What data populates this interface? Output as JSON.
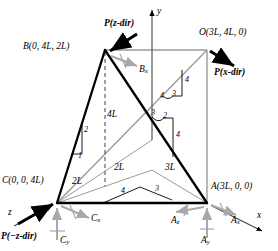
{
  "figure": {
    "type": "engineering-diagram"
  },
  "axes": [
    {
      "name": "y-axis",
      "label": "y"
    },
    {
      "name": "x-axis",
      "label": "x"
    },
    {
      "name": "z-axis",
      "label": "z"
    }
  ],
  "points": [
    {
      "name": "point-B",
      "label": "B(0, 4L, 2L)"
    },
    {
      "name": "point-O",
      "label": "O(3L, 4L, 0)"
    },
    {
      "name": "point-C",
      "label": "C(0, 0, 4L)"
    },
    {
      "name": "point-A",
      "label": "A(3L, 0, 0)"
    }
  ],
  "forces": [
    {
      "name": "force-P-z",
      "label": "P(z-dir)"
    },
    {
      "name": "force-P-x",
      "label": "P(x-dir)"
    },
    {
      "name": "force-P-neg-z",
      "label": "P(−z-dir)"
    }
  ],
  "reactions": [
    {
      "name": "reaction-Bx",
      "base": "B",
      "sub": "x"
    },
    {
      "name": "reaction-Cx",
      "base": "C",
      "sub": "x"
    },
    {
      "name": "reaction-Cy",
      "base": "C",
      "sub": "y"
    },
    {
      "name": "reaction-Az",
      "base": "A",
      "sub": "z"
    },
    {
      "name": "reaction-Ay",
      "base": "A",
      "sub": "y"
    },
    {
      "name": "reaction-Ax",
      "base": "A",
      "sub": "x"
    }
  ],
  "dimensions": [
    {
      "name": "dim-4L-vertical",
      "label": "4L"
    },
    {
      "name": "dim-2L-left",
      "label": "2L"
    },
    {
      "name": "dim-2L-mid",
      "label": "2L"
    },
    {
      "name": "dim-3L-right",
      "label": "3L"
    }
  ],
  "slope_triangles": [
    {
      "name": "slope-BC",
      "values": [
        "2",
        "1"
      ]
    },
    {
      "name": "slope-OC-upper",
      "values": [
        "4",
        "4",
        "3"
      ]
    },
    {
      "name": "slope-BA",
      "values": [
        "3",
        "2",
        "4"
      ]
    },
    {
      "name": "slope-CA-base",
      "values": [
        "4",
        "3"
      ]
    }
  ],
  "colors": {
    "member": "#000000",
    "frame": "#9a9a9a",
    "reaction": "#a8a8a8",
    "background": "#ffffff"
  }
}
